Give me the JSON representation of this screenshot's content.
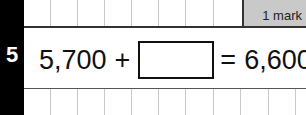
{
  "question": {
    "number": "5",
    "left_operand": "5,700",
    "operator": "+",
    "equals": "=",
    "result": "6,600",
    "answer_value": "",
    "marks_label": "1 mark"
  },
  "colors": {
    "sidebar": "#000000",
    "mark_box": "#c9c9c9",
    "grid_lines": "#c8c8c8"
  }
}
